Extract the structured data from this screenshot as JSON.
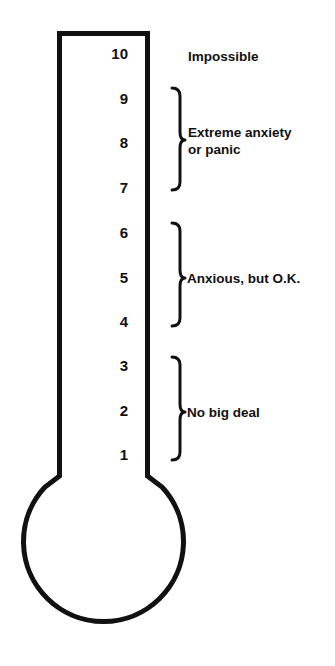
{
  "colors": {
    "stroke": "#111111",
    "background": "#ffffff",
    "text": "#111111"
  },
  "scale": {
    "levels": [
      "10",
      "9",
      "8",
      "7",
      "6",
      "5",
      "4",
      "3",
      "2",
      "1"
    ]
  },
  "labels": {
    "level_10": "Impossible",
    "group_high_line1": "Extreme anxiety",
    "group_high_line2": "or panic",
    "group_mid": "Anxious, but O.K.",
    "group_low": "No big deal"
  },
  "groups": [
    {
      "range": "7-9",
      "label": "Extreme anxiety or panic"
    },
    {
      "range": "4-6",
      "label": "Anxious, but O.K."
    },
    {
      "range": "1-3",
      "label": "No big deal"
    }
  ]
}
